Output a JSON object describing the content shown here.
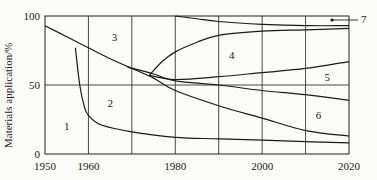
{
  "chart_data": {
    "type": "area",
    "title": "",
    "xlabel": "",
    "ylabel": "Materials application/%",
    "xlim": [
      1950,
      2020
    ],
    "ylim": [
      0,
      100
    ],
    "x_ticks": [
      "1950",
      "1960",
      "1980",
      "2000",
      "2020"
    ],
    "y_ticks": [
      "0",
      "50",
      "100"
    ],
    "grid": {
      "vertical_years": [
        1960,
        1970,
        1980,
        1990,
        2000,
        2010
      ],
      "horizontal_pct": [
        50
      ]
    },
    "region_labels": [
      {
        "label": "1",
        "x": 1955,
        "y": 20
      },
      {
        "label": "2",
        "x": 1965,
        "y": 37
      },
      {
        "label": "3",
        "x": 1966,
        "y": 85
      },
      {
        "label": "4",
        "x": 1993,
        "y": 72
      },
      {
        "label": "5",
        "x": 2015,
        "y": 56
      },
      {
        "label": "6",
        "x": 2013,
        "y": 28
      },
      {
        "label": "7",
        "x": 2023,
        "y": 97
      }
    ],
    "series": [
      {
        "name": "boundary-a",
        "points": [
          [
            1950,
            93
          ],
          [
            1955,
            85
          ],
          [
            1960,
            77
          ],
          [
            1965,
            69
          ],
          [
            1970,
            62
          ],
          [
            1975,
            55
          ],
          [
            1980,
            46
          ],
          [
            1990,
            35
          ],
          [
            2000,
            26
          ],
          [
            2010,
            17
          ],
          [
            2020,
            13
          ]
        ]
      },
      {
        "name": "boundary-1-2",
        "points": [
          [
            1957,
            77
          ],
          [
            1958,
            50
          ],
          [
            1959,
            35
          ],
          [
            1960,
            28
          ],
          [
            1963,
            21
          ],
          [
            1970,
            16
          ],
          [
            1980,
            12
          ],
          [
            1990,
            11
          ],
          [
            2000,
            10
          ],
          [
            2010,
            9
          ],
          [
            2020,
            8
          ]
        ]
      },
      {
        "name": "boundary-3-lower",
        "points": [
          [
            1969,
            63
          ],
          [
            1975,
            58
          ],
          [
            1980,
            53
          ],
          [
            1990,
            50
          ],
          [
            2000,
            46
          ],
          [
            2010,
            43
          ],
          [
            2020,
            39
          ]
        ]
      },
      {
        "name": "boundary-4-lower",
        "points": [
          [
            1974,
            57
          ],
          [
            1980,
            54
          ],
          [
            1990,
            56
          ],
          [
            2000,
            59
          ],
          [
            2010,
            62
          ],
          [
            2020,
            67
          ]
        ]
      },
      {
        "name": "boundary-4-upper",
        "points": [
          [
            1974,
            57
          ],
          [
            1977,
            67
          ],
          [
            1980,
            74
          ],
          [
            1985,
            81
          ],
          [
            1990,
            86
          ],
          [
            2000,
            89
          ],
          [
            2010,
            90
          ],
          [
            2020,
            91
          ]
        ]
      },
      {
        "name": "boundary-7",
        "points": [
          [
            1980,
            100
          ],
          [
            1985,
            98
          ],
          [
            1990,
            96
          ],
          [
            2000,
            94
          ],
          [
            2010,
            93
          ],
          [
            2020,
            93
          ]
        ]
      }
    ]
  }
}
